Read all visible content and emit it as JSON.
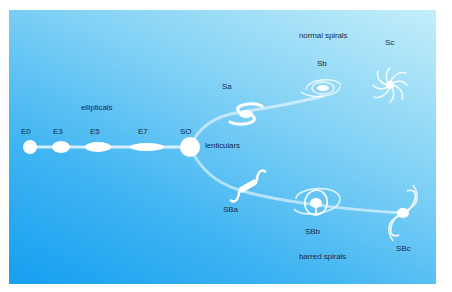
{
  "diagram": {
    "groups": {
      "ellipticals": "ellipticals",
      "lenticulars": "lenticulars",
      "normal_spirals": "normal spirals",
      "barred_spirals": "barred spirals"
    },
    "elliptical_types": [
      "E0",
      "E3",
      "E5",
      "E7"
    ],
    "lenticular_type": "SO",
    "normal_spiral_types": [
      "Sa",
      "Sb",
      "Sc"
    ],
    "barred_spiral_types": [
      "SBa",
      "SBb",
      "SBc"
    ],
    "colors": {
      "background_start": "#159ff0",
      "background_end": "#c4eefa",
      "shape": "#ffffff",
      "text": "#1b2a4a"
    }
  }
}
